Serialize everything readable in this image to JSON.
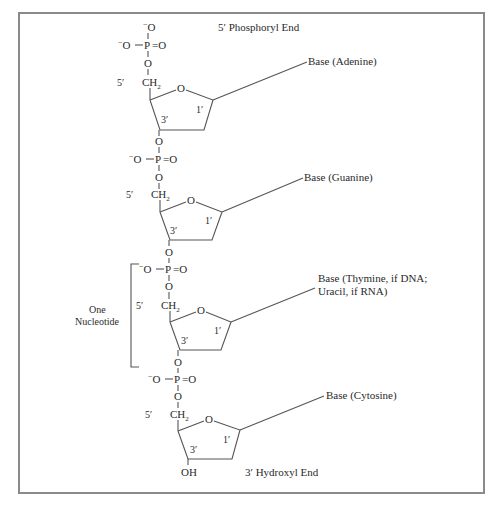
{
  "frame": {
    "x": 19,
    "y": 13,
    "width": 465,
    "height": 480,
    "border_color": "#8a8a8a"
  },
  "labels": {
    "five_prime_end": "5′ Phosphoryl End",
    "three_prime_end": "3′ Hydroxyl End",
    "one_nucleotide_line1": "One",
    "one_nucleotide_line2": "Nucleotide",
    "oh": "OH"
  },
  "chem": {
    "oxygen": "O",
    "phosphorus": "P",
    "double_o": "=O",
    "minus": "−",
    "ch2": "CH",
    "sub2": "2",
    "five_prime": "5′",
    "three_prime": "3′",
    "one_prime": "1′"
  },
  "nucleotides": [
    {
      "base_label": "Base (Adenine)",
      "base_label_line2": ""
    },
    {
      "base_label": "Base (Guanine)",
      "base_label_line2": ""
    },
    {
      "base_label": "Base (Thymine, if DNA;",
      "base_label_line2": "Uracil, if RNA)"
    },
    {
      "base_label": "Base (Cytosine)",
      "base_label_line2": ""
    }
  ]
}
